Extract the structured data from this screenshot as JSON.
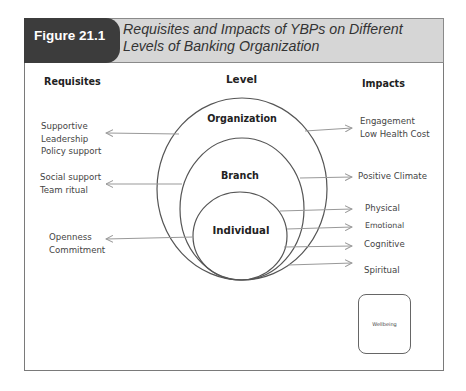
{
  "figure": {
    "number": "Figure 21.1",
    "title_line1": "Requisites and Impacts of YBPs on Different",
    "title_line2": "Levels of Banking Organization"
  },
  "columns": {
    "requisites": "Requisites",
    "level": "Level",
    "impacts": "Impacts"
  },
  "levels": [
    {
      "name": "Organization"
    },
    {
      "name": "Branch"
    },
    {
      "name": "Individual"
    }
  ],
  "requisites": [
    {
      "level": "Organization",
      "lines": [
        "Supportive",
        "Leadership",
        "Policy support"
      ]
    },
    {
      "level": "Branch",
      "lines": [
        "Social support",
        "Team ritual"
      ]
    },
    {
      "level": "Individual",
      "lines": [
        "Openness",
        "Commitment"
      ]
    }
  ],
  "impacts": {
    "organization": [
      "Engagement",
      "Low Health Cost"
    ],
    "branch": [
      "Positive Climate"
    ],
    "individual": [
      "Physical",
      "Emotional",
      "Cognitive",
      "Spiritual"
    ]
  },
  "legend_box": {
    "label": "Wellbeing"
  },
  "colors": {
    "header_tab": "#3c3c3c",
    "header_bg": "#d6d6d6",
    "line": "#555555",
    "arrow": "#999999"
  }
}
